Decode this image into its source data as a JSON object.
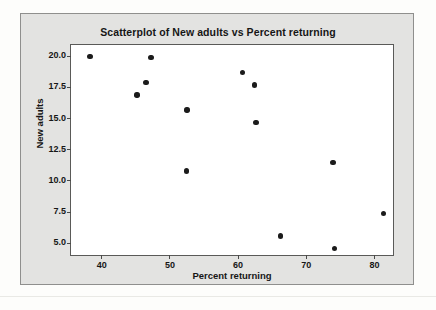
{
  "chart_data": {
    "type": "scatter",
    "title": "Scatterplot of New adults vs Percent returning",
    "xlabel": "Percent returning",
    "ylabel": "New adults",
    "xlim": [
      35.5,
      83.0
    ],
    "ylim": [
      3.9,
      20.9
    ],
    "xticks": [
      40,
      50,
      60,
      70,
      80
    ],
    "yticks": [
      "20.0",
      "17.5",
      "15.0",
      "12.5",
      "10.0",
      "7.5",
      "5.0"
    ],
    "grid": false,
    "legend": "none",
    "series": [
      {
        "name": "New adults vs Percent returning",
        "marker": "filled-circle",
        "color": "#1b1b1b",
        "points": [
          {
            "x": 38.3,
            "y": 20.0
          },
          {
            "x": 47.2,
            "y": 19.9
          },
          {
            "x": 46.5,
            "y": 17.9
          },
          {
            "x": 45.2,
            "y": 16.9
          },
          {
            "x": 52.5,
            "y": 15.7
          },
          {
            "x": 52.4,
            "y": 10.8
          },
          {
            "x": 60.6,
            "y": 18.7
          },
          {
            "x": 62.4,
            "y": 17.7
          },
          {
            "x": 62.6,
            "y": 14.7
          },
          {
            "x": 73.9,
            "y": 11.5
          },
          {
            "x": 81.3,
            "y": 7.4
          },
          {
            "x": 66.2,
            "y": 5.6
          },
          {
            "x": 74.1,
            "y": 4.6
          }
        ]
      }
    ]
  },
  "figure": {
    "panel_background": "#e3e3e1",
    "plot_background": "#ffffff",
    "frame_color": "#5a5a58",
    "text_color": "#161616"
  }
}
